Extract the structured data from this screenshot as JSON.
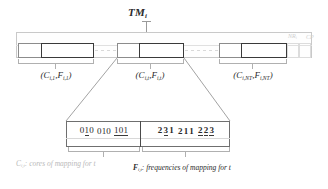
{
  "figure": {
    "title": {
      "base": "TM",
      "subscript": "i"
    },
    "tape": {
      "annotations": [
        {
          "name": "nr-annotation",
          "base": "NR",
          "subscript": "i"
        },
        {
          "name": "cp-annotation",
          "base": "CP",
          "subscript": ""
        }
      ],
      "groups": [
        {
          "id": "group-1",
          "label": "(C i,1 , F i,1 )",
          "label_parts": {
            "c_base": "C",
            "c_sub": "i,1",
            "f_base": "F",
            "f_sub": "i,1"
          }
        },
        {
          "id": "group-t",
          "label": "(C i,t , F i,t )",
          "label_parts": {
            "c_base": "C",
            "c_sub": "i,t",
            "f_base": "F",
            "f_sub": "i,t"
          }
        },
        {
          "id": "group-nt",
          "label": "(C i,NT , F i,NT )",
          "label_parts": {
            "c_base": "C",
            "c_sub": "i,NT",
            "f_base": "F",
            "f_sub": "i,NT"
          }
        }
      ]
    },
    "detail": {
      "cores": {
        "digits": "010 010 101",
        "chunks": [
          {
            "digits": [
              {
                "d": "0",
                "underline": false
              },
              {
                "d": "1",
                "underline": true
              },
              {
                "d": "0",
                "underline": false
              }
            ]
          },
          {
            "digits": [
              {
                "d": "0",
                "underline": false
              },
              {
                "d": "1",
                "underline": false
              },
              {
                "d": "0",
                "underline": false
              }
            ]
          },
          {
            "digits": [
              {
                "d": "1",
                "underline": true
              },
              {
                "d": "0",
                "underline": true
              },
              {
                "d": "1",
                "underline": true
              }
            ]
          }
        ]
      },
      "frequencies": {
        "digits": "231 211 223",
        "chunks": [
          {
            "digits": [
              {
                "d": "2",
                "underline": false
              },
              {
                "d": "3",
                "underline": true
              },
              {
                "d": "1",
                "underline": false
              }
            ]
          },
          {
            "digits": [
              {
                "d": "2",
                "underline": false
              },
              {
                "d": "1",
                "underline": false
              },
              {
                "d": "1",
                "underline": false
              }
            ]
          },
          {
            "digits": [
              {
                "d": "2",
                "underline": true
              },
              {
                "d": "2",
                "underline": true
              },
              {
                "d": "3",
                "underline": true
              }
            ]
          }
        ]
      }
    },
    "captions": {
      "cores": {
        "symbol_base": "C",
        "symbol_sub": "i,t",
        "text": ": cores of mapping for t"
      },
      "frequencies": {
        "symbol_base": "F",
        "symbol_sub": "i,t",
        "text": ": frequencies of mapping for t"
      }
    }
  },
  "colors": {
    "ink": "#2b2b2b",
    "light_ink": "#8c8c8c",
    "faint": "#cfcfcf",
    "box_border": "#3a3a3a",
    "tape_border": "#c9c9c9"
  }
}
